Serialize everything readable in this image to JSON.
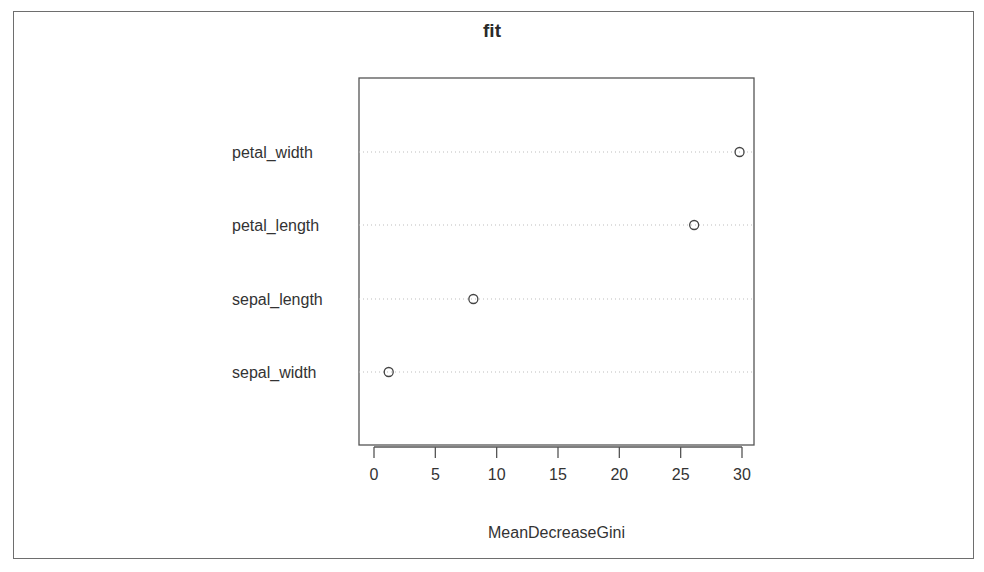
{
  "chart_data": {
    "type": "scatter",
    "subtype": "dotchart",
    "title": "fit",
    "xlabel": "MeanDecreaseGini",
    "ylabel": "",
    "categories": [
      "petal_width",
      "petal_length",
      "sepal_length",
      "sepal_width"
    ],
    "values": [
      29.8,
      26.1,
      8.1,
      1.2
    ],
    "xlim": [
      -1.2,
      30.9
    ],
    "xticks": [
      0,
      5,
      10,
      15,
      20,
      25,
      30
    ],
    "xtick_labels": [
      "0",
      "5",
      "10",
      "15",
      "20",
      "25",
      "30"
    ],
    "grid": "dotted horizontal lines per category",
    "legend": null,
    "marker": "open circle"
  }
}
